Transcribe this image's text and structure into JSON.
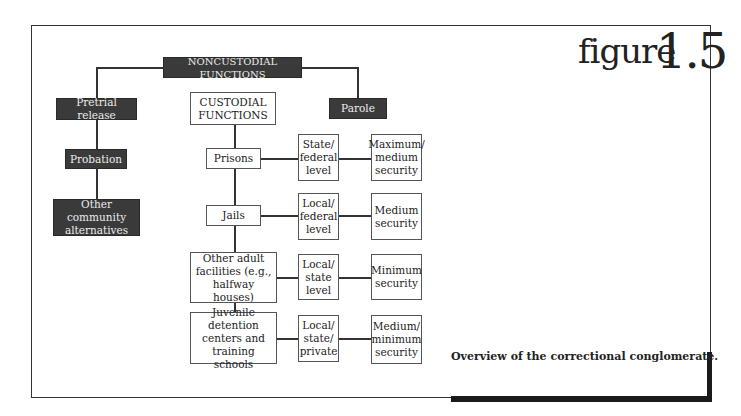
{
  "figure": {
    "word": "figure",
    "number": "1.5"
  },
  "caption": "Overview of the correctional conglomerate.",
  "noncustodial": {
    "root": "NONCUSTODIAL FUNCTIONS",
    "pretrial": "Pretrial release",
    "probation": "Probation",
    "other_community": "Other community alternatives",
    "parole": "Parole"
  },
  "custodial": {
    "root": "CUSTODIAL FUNCTIONS",
    "rows": [
      {
        "facility": "Prisons",
        "level": "State/ federal level",
        "security": "Maximum/ medium security"
      },
      {
        "facility": "Jails",
        "level": "Local/ federal level",
        "security": "Medium security"
      },
      {
        "facility": "Other adult facilities (e.g., halfway houses)",
        "level": "Local/ state level",
        "security": "Minimum security"
      },
      {
        "facility": "Juvenile detention centers and training schools",
        "level": "Local/ state/ private",
        "security": "Medium/ minimum security"
      }
    ]
  },
  "colors": {
    "dark_box": "#3a3a3a",
    "dark_text": "#ececec",
    "line": "#333333"
  }
}
